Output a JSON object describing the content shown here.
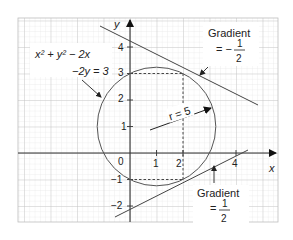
{
  "figure": {
    "axes": {
      "x_label": "x",
      "y_label": "y",
      "x_ticks": [
        {
          "value": 1,
          "label": "1"
        },
        {
          "value": 2,
          "label": "2"
        },
        {
          "value": 4,
          "label": "4"
        }
      ],
      "y_ticks": [
        {
          "value": 4,
          "label": "4"
        },
        {
          "value": 3,
          "label": "3"
        },
        {
          "value": 2,
          "label": "2"
        },
        {
          "value": 1,
          "label": "1"
        },
        {
          "value": -1,
          "label": "−1"
        },
        {
          "value": -2,
          "label": "−2"
        }
      ],
      "origin_label": "0"
    },
    "circle": {
      "equation_line1": "x² + y² − 2x",
      "equation_line2": "−2y = 3",
      "center": [
        1,
        1
      ],
      "radius_label": "r = 5"
    },
    "tangent_upper": {
      "label_line1": "Gradient",
      "label_eq": "= −",
      "label_num": "1",
      "label_den": "2",
      "point": [
        2,
        3
      ],
      "gradient": -0.5
    },
    "tangent_lower": {
      "label_line1": "Gradient",
      "label_eq": "=",
      "label_num": "1",
      "label_den": "2",
      "point": [
        2,
        -1
      ],
      "gradient": 0.5
    },
    "colors": {
      "grid_minor": "#e2e2e2",
      "grid_major": "#c4c4c4",
      "axis": "#333333",
      "curve": "#555555"
    }
  }
}
